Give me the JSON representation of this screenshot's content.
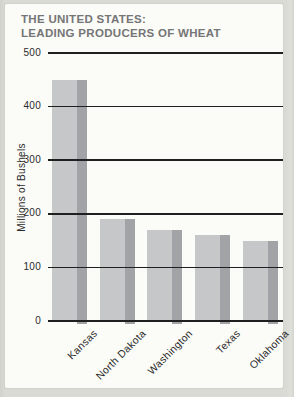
{
  "title": {
    "line1": "THE UNITED STATES:",
    "line2": "LEADING PRODUCERS OF WHEAT"
  },
  "chart_data": {
    "type": "bar",
    "title": "THE UNITED STATES: LEADING PRODUCERS OF WHEAT",
    "categories": [
      "Kansas",
      "North Dakota",
      "Washington",
      "Texas",
      "Oklahoma"
    ],
    "values": [
      450,
      190,
      170,
      160,
      150
    ],
    "xlabel": "",
    "ylabel": "Millions of Bushels",
    "ylim": [
      0,
      500
    ],
    "yticks": [
      0,
      100,
      200,
      300,
      400,
      500
    ],
    "grid": true,
    "grid_on_top_of_bars": true,
    "legend": false
  },
  "colors": {
    "bar_face": "#c6c7c9",
    "bar_side": "#a2a3a7",
    "grid_line": "#1f1f1f",
    "title_text": "#757575",
    "axis_text": "#2b2b2b",
    "page_bg": "#fbfbf8",
    "outer_bg": "#d5d6d0"
  }
}
